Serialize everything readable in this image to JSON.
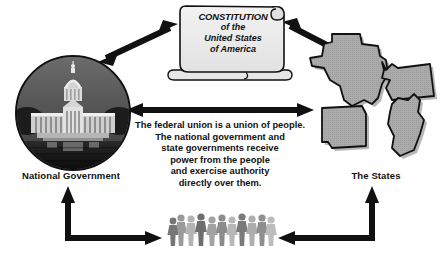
{
  "diagram": {
    "title_hidden": "",
    "nodes": {
      "national_government": {
        "label": "National Government",
        "icon": "capitol-building-photo"
      },
      "states": {
        "label": "The States",
        "icon": "state-outlines",
        "shapes": [
          "Texas",
          "Washington",
          "Arkansas",
          "Maine"
        ]
      },
      "constitution": {
        "icon": "scroll-icon",
        "line1": "CONSTITUTION",
        "line2": "of the",
        "line3": "United States",
        "line4": "of America"
      },
      "people": {
        "icon": "crowd-silhouette-icon",
        "count": 11
      }
    },
    "center_text": {
      "line1": "The federal union is a union of people.",
      "line2": "The national government and",
      "line3": "state governments receive",
      "line4": "power from the people",
      "line5": "and exercise authority",
      "line6": "directly over them."
    },
    "connectors": [
      {
        "name": "arrow-national-to-constitution",
        "style": "double-headed-diagonal"
      },
      {
        "name": "arrow-constitution-to-states",
        "style": "double-headed-diagonal"
      },
      {
        "name": "arrow-national-to-states",
        "style": "double-headed-horizontal"
      },
      {
        "name": "arrow-people-to-national",
        "style": "double-headed-elbow"
      },
      {
        "name": "arrow-people-to-states",
        "style": "double-headed-elbow"
      }
    ],
    "colors": {
      "arrow": "#111111",
      "state_fill": "#a9a9a9",
      "state_stroke": "#111111",
      "scroll_fill": "#ededed",
      "scroll_stroke": "#111111",
      "text": "#111111",
      "background": "#ffffff"
    }
  }
}
